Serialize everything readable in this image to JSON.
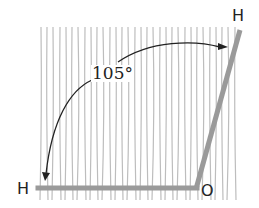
{
  "diagram": {
    "type": "molecular-bond-angle",
    "atoms": {
      "hydrogen_top": "H",
      "hydrogen_left": "H",
      "oxygen": "O"
    },
    "angle_label": "105°",
    "colors": {
      "bond": "#9a9a9a",
      "arc": "#222222",
      "background_lines": "#b8b8b8",
      "text": "#222222"
    }
  }
}
